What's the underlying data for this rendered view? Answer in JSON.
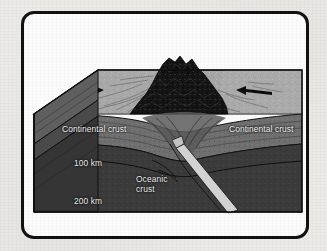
{
  "figure": {
    "type": "geologic-block-diagram",
    "frame": {
      "border_color": "#111111",
      "background_color": "#fbfbfb",
      "page_background_color": "#eceae7"
    },
    "labels": {
      "continental_crust_left": "Continental crust",
      "continental_crust_right": "Continental crust",
      "depth_100km": "100 km",
      "depth_200km": "200 km",
      "oceanic_crust": "Oceanic crust"
    },
    "depth_scale": {
      "unit": "km",
      "ticks": [
        100,
        200
      ]
    },
    "colors": {
      "top_surface": "#a6a6a6",
      "crust_band": "#6f6f6f",
      "mantle": "#3b3b3b",
      "deep_mantle": "#333333",
      "mountains": "#141414",
      "slab": "#cfcfcf",
      "outline": "#111111",
      "label_text": "#f2f2f2"
    },
    "arrows": [
      {
        "name": "convergence-arrow-left",
        "direction": "right"
      },
      {
        "name": "convergence-arrow-right",
        "direction": "left"
      }
    ]
  }
}
